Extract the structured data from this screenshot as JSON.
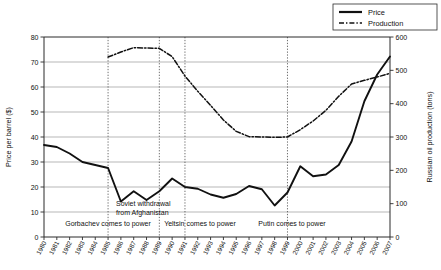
{
  "chart_data": {
    "type": "line",
    "title": "",
    "xlabel": "",
    "grid": "horizontal",
    "legend_position": "top-right",
    "categories": [
      "1980",
      "1981",
      "1982",
      "1983",
      "1984",
      "1985",
      "1986",
      "1987",
      "1988",
      "1989",
      "1990",
      "1991",
      "1992",
      "1993",
      "1994",
      "1995",
      "1996",
      "1997",
      "1998",
      "1999",
      "2000",
      "2001",
      "2002",
      "2003",
      "2004",
      "2005",
      "2006",
      "2007"
    ],
    "axes": {
      "left": {
        "label": "Price per barrel ($)",
        "min": 0,
        "max": 80,
        "step": 10,
        "ticks": [
          "0",
          "10",
          "20",
          "30",
          "40",
          "50",
          "60",
          "70",
          "80"
        ]
      },
      "right": {
        "label": "Russian oil production (tons)",
        "min": 0,
        "max": 600,
        "step": 100,
        "ticks": [
          "0",
          "100",
          "200",
          "300",
          "400",
          "500",
          "600"
        ]
      }
    },
    "series": [
      {
        "name": "Price",
        "axis": "left",
        "style": "solid",
        "values": [
          36.8,
          36.0,
          33.4,
          30.0,
          28.8,
          27.6,
          14.2,
          18.3,
          14.8,
          18.3,
          23.4,
          20.0,
          19.3,
          17.0,
          15.7,
          17.2,
          20.4,
          19.1,
          12.6,
          17.8,
          28.3,
          24.3,
          25.0,
          28.8,
          38.2,
          54.3,
          65.0,
          72.2
        ]
      },
      {
        "name": "Production",
        "axis": "right",
        "style": "dash-dot",
        "values": [
          null,
          null,
          null,
          null,
          null,
          540,
          555,
          568,
          567,
          566,
          541,
          483,
          437,
          395,
          351,
          317,
          301,
          300,
          299,
          300,
          322,
          348,
          380,
          422,
          459,
          470,
          480,
          491
        ]
      }
    ],
    "event_annotations": [
      {
        "label": "Gorbachev comes to power",
        "year": "1985",
        "line_year": "1985"
      },
      {
        "label": "Soviet withdrawal\nfrom Afghanistan",
        "line1": "Soviet withdrawal",
        "line2": "from Afghanistan",
        "year": "1989",
        "line_year": "1989"
      },
      {
        "label": "Yeltsin comes to power",
        "year": "1991",
        "line_year": "1991"
      },
      {
        "label": "Putin comes to power",
        "year": "1999",
        "line_year": "1999"
      }
    ],
    "legend": [
      {
        "label": "Price",
        "style": "solid"
      },
      {
        "label": "Production",
        "style": "dash-dot"
      }
    ]
  }
}
